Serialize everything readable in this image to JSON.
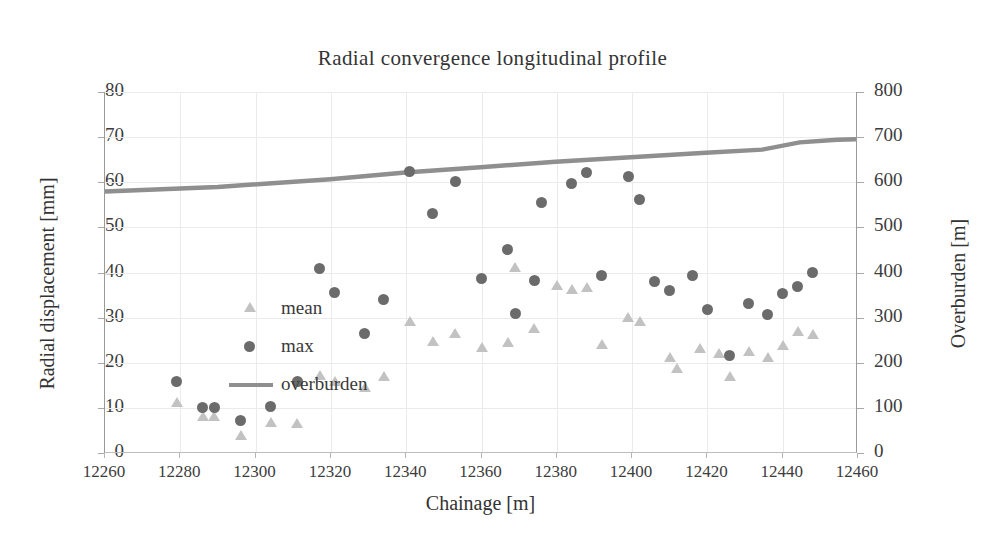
{
  "chart_data": {
    "type": "scatter",
    "title": "Radial convergence longitudinal profile",
    "xlabel": "Chainage [m]",
    "ylabel": "Radial displacement [mm]",
    "ylabel_right": "Overburden [m]",
    "xlim": [
      12260,
      12460
    ],
    "ylim": [
      0,
      80
    ],
    "ylim_right": [
      0,
      800
    ],
    "xticks": [
      "12260",
      "12280",
      "12300",
      "12320",
      "12340",
      "12360",
      "12380",
      "12400",
      "12420",
      "12440",
      "12460"
    ],
    "yticks": [
      "0",
      "10",
      "20",
      "30",
      "40",
      "50",
      "60",
      "70",
      "80"
    ],
    "yticks_right": [
      "0",
      "100",
      "200",
      "300",
      "400",
      "500",
      "600",
      "700",
      "800"
    ],
    "grid": true,
    "legend_position": "inside-left",
    "colors": {
      "mean": "#c2c2c2",
      "max": "#6b6b6b",
      "overburden": "#8f8f8f",
      "grid": "#eceaea",
      "axis": "#9a9a9a",
      "text": "#3a3a3a"
    },
    "series": [
      {
        "name": "mean",
        "marker": "triangle",
        "axis": "left",
        "points": [
          [
            12279,
            11.2
          ],
          [
            12286,
            8.3
          ],
          [
            12289,
            8.1
          ],
          [
            12296,
            4.0
          ],
          [
            12304,
            6.8
          ],
          [
            12311,
            6.6
          ],
          [
            12317,
            17.3
          ],
          [
            12321,
            16.0
          ],
          [
            12329,
            14.7
          ],
          [
            12334,
            17.0
          ],
          [
            12341,
            29.2
          ],
          [
            12347,
            24.8
          ],
          [
            12353,
            26.5
          ],
          [
            12360,
            23.4
          ],
          [
            12367,
            24.5
          ],
          [
            12369,
            41.2
          ],
          [
            12374,
            27.6
          ],
          [
            12380,
            37.3
          ],
          [
            12384,
            36.3
          ],
          [
            12388,
            36.7
          ],
          [
            12392,
            24.1
          ],
          [
            12399,
            30.2
          ],
          [
            12402,
            29.2
          ],
          [
            12410,
            21.2
          ],
          [
            12412,
            18.9
          ],
          [
            12418,
            23.2
          ],
          [
            12423,
            22.1
          ],
          [
            12426,
            17.0
          ],
          [
            12431,
            22.6
          ],
          [
            12436,
            21.2
          ],
          [
            12440,
            23.9
          ],
          [
            12444,
            27.0
          ],
          [
            12448,
            26.3
          ]
        ]
      },
      {
        "name": "max",
        "marker": "circle",
        "axis": "left",
        "points": [
          [
            12279,
            15.8
          ],
          [
            12286,
            10.0
          ],
          [
            12289,
            10.1
          ],
          [
            12296,
            7.3
          ],
          [
            12304,
            10.2
          ],
          [
            12311,
            15.9
          ],
          [
            12317,
            40.9
          ],
          [
            12321,
            35.5
          ],
          [
            12329,
            26.5
          ],
          [
            12334,
            34.1
          ],
          [
            12341,
            62.3
          ],
          [
            12347,
            53.0
          ],
          [
            12353,
            60.1
          ],
          [
            12360,
            38.6
          ],
          [
            12367,
            45.2
          ],
          [
            12369,
            31.0
          ],
          [
            12374,
            38.2
          ],
          [
            12376,
            55.6
          ],
          [
            12384,
            59.7
          ],
          [
            12388,
            62.2
          ],
          [
            12392,
            39.3
          ],
          [
            12399,
            61.2
          ],
          [
            12402,
            56.1
          ],
          [
            12406,
            38.0
          ],
          [
            12410,
            36.0
          ],
          [
            12416,
            39.4
          ],
          [
            12420,
            31.7
          ],
          [
            12426,
            21.5
          ],
          [
            12431,
            33.2
          ],
          [
            12436,
            30.8
          ],
          [
            12440,
            35.4
          ],
          [
            12444,
            36.9
          ],
          [
            12448,
            40.0
          ]
        ]
      },
      {
        "name": "overburden",
        "marker": "line",
        "axis": "right",
        "points": [
          [
            12260,
            579
          ],
          [
            12290,
            589
          ],
          [
            12320,
            606
          ],
          [
            12340,
            621
          ],
          [
            12360,
            633
          ],
          [
            12380,
            645
          ],
          [
            12400,
            655
          ],
          [
            12420,
            665
          ],
          [
            12435,
            672
          ],
          [
            12445,
            688
          ],
          [
            12455,
            694
          ],
          [
            12460,
            695
          ]
        ]
      }
    ]
  },
  "legend": {
    "items": [
      {
        "label": "mean"
      },
      {
        "label": "max"
      },
      {
        "label": "overburden"
      }
    ]
  }
}
